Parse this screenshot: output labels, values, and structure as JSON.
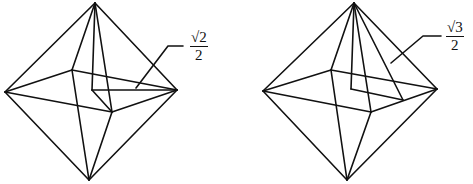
{
  "figures": [
    {
      "name": "octahedron-left",
      "stroke": "#111111",
      "vertices": {
        "top": [
          95,
          3
        ],
        "left": [
          5,
          92
        ],
        "right": [
          177,
          90
        ],
        "bottom": [
          89,
          180
        ],
        "back": [
          72,
          70
        ],
        "front": [
          112,
          112
        ],
        "center": [
          92,
          90
        ]
      },
      "edges": [
        [
          "top",
          "left"
        ],
        [
          "top",
          "right"
        ],
        [
          "top",
          "back"
        ],
        [
          "top",
          "front"
        ],
        [
          "bottom",
          "left"
        ],
        [
          "bottom",
          "right"
        ],
        [
          "bottom",
          "back"
        ],
        [
          "bottom",
          "front"
        ],
        [
          "left",
          "back"
        ],
        [
          "back",
          "right"
        ],
        [
          "right",
          "front"
        ],
        [
          "front",
          "left"
        ]
      ],
      "extra_segments": [
        [
          [
            95,
            3
          ],
          [
            92,
            90
          ]
        ],
        [
          [
            92,
            90
          ],
          [
            177,
            90
          ]
        ],
        [
          [
            92,
            90
          ],
          [
            112,
            112
          ]
        ]
      ],
      "leader": [
        [
          136,
          88
        ],
        [
          168,
          46
        ],
        [
          183,
          46
        ]
      ],
      "label": {
        "num": "√2",
        "den": "2",
        "x": 190,
        "y": 30
      }
    },
    {
      "name": "octahedron-right",
      "stroke": "#111111",
      "vertices": {
        "top": [
          354,
          3
        ],
        "left": [
          263,
          91
        ],
        "right": [
          437,
          89
        ],
        "bottom": [
          347,
          180
        ],
        "back": [
          331,
          70
        ],
        "front": [
          371,
          112
        ],
        "center": [
          351,
          89
        ],
        "mid": [
          403,
          100
        ]
      },
      "edges": [
        [
          "top",
          "left"
        ],
        [
          "top",
          "right"
        ],
        [
          "top",
          "back"
        ],
        [
          "top",
          "front"
        ],
        [
          "bottom",
          "left"
        ],
        [
          "bottom",
          "right"
        ],
        [
          "bottom",
          "back"
        ],
        [
          "bottom",
          "front"
        ],
        [
          "left",
          "back"
        ],
        [
          "back",
          "right"
        ],
        [
          "right",
          "front"
        ],
        [
          "front",
          "left"
        ]
      ],
      "extra_segments": [
        [
          [
            354,
            3
          ],
          [
            351,
            89
          ]
        ],
        [
          [
            351,
            89
          ],
          [
            403,
            100
          ]
        ],
        [
          [
            354,
            3
          ],
          [
            403,
            100
          ]
        ]
      ],
      "leader": [
        [
          391,
          63
        ],
        [
          423,
          36
        ],
        [
          441,
          36
        ]
      ],
      "label": {
        "num": "√3",
        "den": "2",
        "x": 446,
        "y": 20
      }
    }
  ]
}
